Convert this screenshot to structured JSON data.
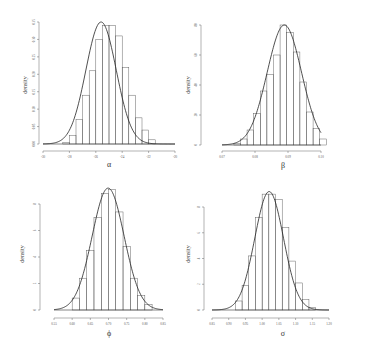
{
  "chart_data": [
    {
      "type": "bar",
      "id": "alpha",
      "title": "",
      "xlabel": "α",
      "ylabel": "density",
      "xlim": [
        -30,
        -20
      ],
      "ylim": [
        0,
        0.35
      ],
      "xticks": [
        -30,
        -28,
        -26,
        -24,
        -22,
        -20
      ],
      "yticks": [
        0.0,
        0.05,
        0.1,
        0.15,
        0.2,
        0.25,
        0.3,
        0.35
      ],
      "grid": false,
      "bin_width": 0.5,
      "bin_edges_start": -28.5,
      "bar_heights": [
        0.005,
        0.025,
        0.07,
        0.14,
        0.21,
        0.3,
        0.34,
        0.34,
        0.31,
        0.22,
        0.14,
        0.075,
        0.04,
        0.012
      ],
      "density_curve": {
        "mean": -25.6,
        "sd": 1.15,
        "peak": 0.35
      },
      "px": {
        "x0": 43,
        "x1": 175,
        "ybase": 144,
        "ytop": 22,
        "yaxis_x": 39,
        "xaxis_y": 151
      }
    },
    {
      "type": "bar",
      "id": "beta",
      "title": "",
      "xlabel": "β",
      "ylabel": "density",
      "xlim": [
        0.07,
        0.1
      ],
      "ylim": [
        0,
        80
      ],
      "xticks": [
        0.07,
        0.08,
        0.09,
        0.1
      ],
      "yticks": [
        0,
        20,
        40,
        60,
        80
      ],
      "grid": false,
      "bin_width": 0.002,
      "bin_edges_start": 0.0736,
      "bar_heights": [
        1,
        4,
        10,
        21,
        36,
        47,
        60,
        80,
        75,
        62,
        42,
        22,
        11,
        4
      ],
      "density_curve": {
        "mean": 0.0889,
        "sd": 0.0052,
        "peak": 80
      },
      "px": {
        "x0": 222,
        "x1": 321,
        "ybase": 145,
        "ytop": 25,
        "yaxis_x": 201,
        "xaxis_y": 151
      }
    },
    {
      "type": "bar",
      "id": "phi",
      "title": "",
      "xlabel": "ϕ",
      "ylabel": "density",
      "xlim": [
        0.55,
        0.85
      ],
      "ylim": [
        0,
        8
      ],
      "xticks": [
        0.55,
        0.6,
        0.65,
        0.7,
        0.75,
        0.8,
        0.85
      ],
      "yticks": [
        0,
        2,
        4,
        6,
        8
      ],
      "grid": false,
      "bin_width": 0.02,
      "bin_edges_start": 0.6,
      "bar_heights": [
        0.9,
        2.4,
        4.5,
        7.0,
        8.8,
        9.1,
        7.4,
        4.8,
        2.4,
        1.1,
        0.4
      ],
      "density_curve": {
        "mean": 0.699,
        "sd": 0.044,
        "peak": 9.2
      },
      "px": {
        "x0": 54,
        "x1": 163,
        "ybase": 310,
        "ytop": 204,
        "yaxis_x": 40,
        "xaxis_y": 318
      }
    },
    {
      "type": "bar",
      "id": "sigma",
      "title": "",
      "xlabel": "σ",
      "ylabel": "density",
      "xlim": [
        0.85,
        1.2
      ],
      "ylim": [
        0,
        8
      ],
      "xticks": [
        0.85,
        0.9,
        0.95,
        1.0,
        1.05,
        1.1,
        1.15,
        1.2
      ],
      "yticks": [
        0,
        2,
        4,
        6,
        8
      ],
      "grid": false,
      "bin_width": 0.02,
      "bin_edges_start": 0.92,
      "bar_heights": [
        0.7,
        1.9,
        4.2,
        7.2,
        9.0,
        9.0,
        8.6,
        6.4,
        3.8,
        2.1,
        0.8,
        0.2
      ],
      "density_curve": {
        "mean": 1.021,
        "sd": 0.043,
        "peak": 9.2
      },
      "px": {
        "x0": 212,
        "x1": 329,
        "ybase": 310,
        "ytop": 207,
        "yaxis_x": 204,
        "xaxis_y": 318
      }
    }
  ],
  "panels": [
    {
      "ylabel": "density",
      "xlabel": "α"
    },
    {
      "ylabel": "density",
      "xlabel": "β"
    },
    {
      "ylabel": "density",
      "xlabel": "ϕ"
    },
    {
      "ylabel": "density",
      "xlabel": "σ"
    }
  ]
}
